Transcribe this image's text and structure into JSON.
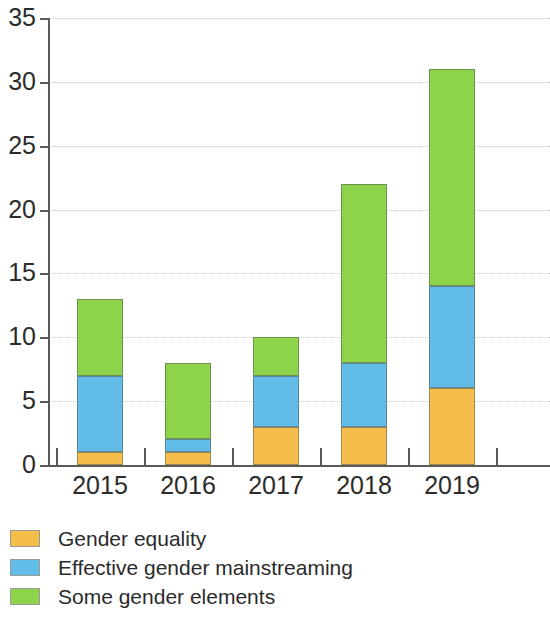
{
  "chart_data": {
    "type": "bar",
    "stacked": true,
    "title": "",
    "subtitle": "",
    "xlabel": "",
    "ylabel": "",
    "categories": [
      "2015",
      "2016",
      "2017",
      "2018",
      "2019"
    ],
    "series": [
      {
        "name": "Gender equality",
        "color": "#F5BE4B",
        "values": [
          1,
          1,
          3,
          3,
          6
        ]
      },
      {
        "name": "Effective gender mainstreaming",
        "color": "#61BCE8",
        "values": [
          6,
          1,
          4,
          5,
          8
        ]
      },
      {
        "name": "Some gender elements",
        "color": "#8DD44A",
        "values": [
          6,
          6,
          3,
          14,
          17
        ]
      }
    ],
    "totals": [
      13,
      8,
      10,
      22,
      31
    ],
    "ylim": [
      0,
      35
    ],
    "ytick_labels": [
      "0",
      "5",
      "10",
      "15",
      "20",
      "25",
      "30",
      "35"
    ],
    "ytick_values": [
      0,
      5,
      10,
      15,
      20,
      25,
      30,
      35
    ],
    "grid": true,
    "grid_axis": "y",
    "legend_position": "bottom-left",
    "legend": [
      {
        "label": "Gender equality",
        "color": "#F5BE4B"
      },
      {
        "label": "Effective gender mainstreaming",
        "color": "#61BCE8"
      },
      {
        "label": "Some gender elements",
        "color": "#8DD44A"
      }
    ],
    "colors": {
      "gender_equality": "#F5BE4B",
      "effective_gender_mainstreaming": "#61BCE8",
      "some_gender_elements": "#8DD44A",
      "axis": "#5A5A5A",
      "gridline": "#C9C9C9",
      "text": "#2B2B2B",
      "background": "#FFFFFF"
    }
  }
}
